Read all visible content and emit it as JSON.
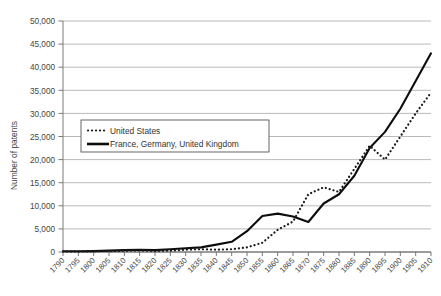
{
  "chart_data": {
    "type": "line",
    "title": "",
    "xlabel": "",
    "ylabel": "Number of patents",
    "xlim": [
      1790,
      1910
    ],
    "ylim": [
      0,
      50000
    ],
    "grid": true,
    "legend_position": "upper-left-inside",
    "x": [
      1790,
      1795,
      1800,
      1805,
      1810,
      1815,
      1820,
      1825,
      1830,
      1835,
      1840,
      1845,
      1850,
      1855,
      1860,
      1865,
      1870,
      1875,
      1880,
      1885,
      1890,
      1895,
      1900,
      1905,
      1910
    ],
    "categories": [
      "1790",
      "1795",
      "1800",
      "1805",
      "1810",
      "1815",
      "1820",
      "1825",
      "1830",
      "1835",
      "1840",
      "1845",
      "1850",
      "1855",
      "1860",
      "1865",
      "1870",
      "1875",
      "1880",
      "1885",
      "1890",
      "1895",
      "1900",
      "1905",
      "1910"
    ],
    "series": [
      {
        "name": "United States",
        "style": "dotted",
        "color": "#1a1a1a",
        "values": [
          100,
          100,
          150,
          200,
          250,
          300,
          200,
          300,
          500,
          600,
          500,
          600,
          1000,
          2000,
          4800,
          6600,
          12500,
          14000,
          13000,
          18000,
          23000,
          20000,
          25000,
          30000,
          34500
        ]
      },
      {
        "name": "France, Germany, United Kingdom",
        "style": "solid",
        "color": "#0d0d0d",
        "values": [
          150,
          150,
          200,
          300,
          400,
          500,
          400,
          600,
          800,
          1000,
          1600,
          2200,
          4500,
          7800,
          8300,
          7700,
          6500,
          10500,
          12500,
          16500,
          22500,
          26000,
          31000,
          37000,
          43000
        ]
      }
    ],
    "yticks": [
      0,
      5000,
      10000,
      15000,
      20000,
      25000,
      30000,
      35000,
      40000,
      45000,
      50000
    ],
    "ytick_labels": [
      "0",
      "5,000",
      "10,000",
      "15,000",
      "20,000",
      "25,000",
      "30,000",
      "35,000",
      "40,000",
      "45,000",
      "50,000"
    ]
  },
  "legend": {
    "items": [
      {
        "label": "United States",
        "marker": "dotted-line-swatch"
      },
      {
        "label": "France, Germany, United Kingdom",
        "marker": "solid-line-swatch"
      }
    ]
  },
  "caption": {
    "label": "",
    "text": ""
  }
}
